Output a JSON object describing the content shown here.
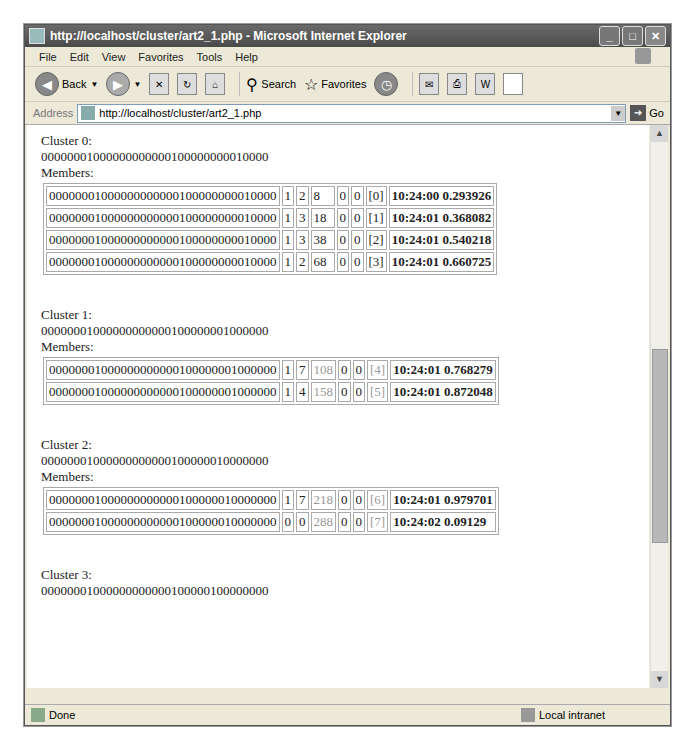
{
  "window": {
    "title": "http://localhost/cluster/art2_1.php - Microsoft Internet Explorer",
    "controls": [
      "minimize",
      "maximize",
      "close"
    ]
  },
  "menu": [
    "File",
    "Edit",
    "View",
    "Favorites",
    "Tools",
    "Help"
  ],
  "toolbar": {
    "back_label": "Back",
    "search_label": "Search",
    "favorites_label": "Favorites"
  },
  "address": {
    "label": "Address",
    "url": "http://localhost/cluster/art2_1.php",
    "go_label": "Go"
  },
  "clusters": [
    {
      "heading": "Cluster 0:",
      "prototype": "00000001000000000000100000000010000",
      "members_label": "Members:",
      "members": [
        {
          "pattern": "00000001000000000000100000000010000",
          "a": "1",
          "b": "2",
          "c": "8",
          "d": "0",
          "e": "0",
          "idx": "[0]",
          "time": "10:24:00 0.293926"
        },
        {
          "pattern": "00000001000000000000100000000010000",
          "a": "1",
          "b": "3",
          "c": "18",
          "d": "0",
          "e": "0",
          "idx": "[1]",
          "time": "10:24:01 0.368082"
        },
        {
          "pattern": "00000001000000000000100000000010000",
          "a": "1",
          "b": "3",
          "c": "38",
          "d": "0",
          "e": "0",
          "idx": "[2]",
          "time": "10:24:01 0.540218"
        },
        {
          "pattern": "00000001000000000000100000000010000",
          "a": "1",
          "b": "2",
          "c": "68",
          "d": "0",
          "e": "0",
          "idx": "[3]",
          "time": "10:24:01 0.660725"
        }
      ]
    },
    {
      "heading": "Cluster 1:",
      "prototype": "00000001000000000000100000001000000",
      "members_label": "Members:",
      "members": [
        {
          "pattern": "00000001000000000000100000001000000",
          "a": "1",
          "b": "7",
          "c": "108",
          "d": "0",
          "e": "0",
          "idx": "[4]",
          "time": "10:24:01 0.768279"
        },
        {
          "pattern": "00000001000000000000100000001000000",
          "a": "1",
          "b": "4",
          "c": "158",
          "d": "0",
          "e": "0",
          "idx": "[5]",
          "time": "10:24:01 0.872048"
        }
      ]
    },
    {
      "heading": "Cluster 2:",
      "prototype": "00000001000000000000100000010000000",
      "members_label": "Members:",
      "members": [
        {
          "pattern": "00000001000000000000100000010000000",
          "a": "1",
          "b": "7",
          "c": "218",
          "d": "0",
          "e": "0",
          "idx": "[6]",
          "time": "10:24:01 0.979701"
        },
        {
          "pattern": "00000001000000000000100000010000000",
          "a": "0",
          "b": "0",
          "c": "288",
          "d": "0",
          "e": "0",
          "idx": "[7]",
          "time": "10:24:02 0.09129"
        }
      ]
    },
    {
      "heading": "Cluster 3:",
      "prototype": "00000001000000000000100000100000000"
    }
  ],
  "status": {
    "text": "Done",
    "zone": "Local intranet"
  }
}
